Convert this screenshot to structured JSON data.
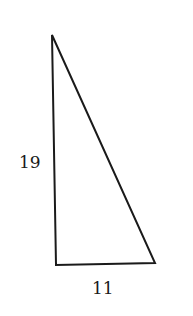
{
  "diagram": {
    "type": "right-triangle",
    "vertices": {
      "top": [
        52,
        35
      ],
      "bottom_left": [
        56,
        265
      ],
      "bottom_right": [
        155,
        263
      ]
    },
    "labels": {
      "vertical_side": "19",
      "horizontal_side": "11"
    },
    "stroke_color": "#1a1a1a"
  }
}
